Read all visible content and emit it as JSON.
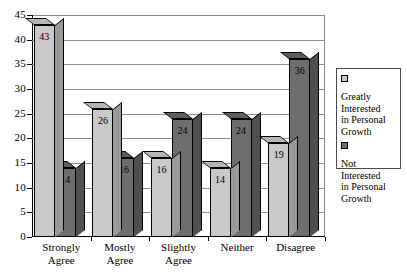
{
  "chart_data": {
    "type": "bar",
    "title": "",
    "subtitle": "",
    "xlabel": "",
    "ylabel": "",
    "categories": [
      "Strongly Agree",
      "Mostly Agree",
      "Slightly Agree",
      "Neither",
      "Disagree"
    ],
    "category_lines": [
      [
        "Strongly",
        "Agree"
      ],
      [
        "Mostly",
        "Agree"
      ],
      [
        "Slightly",
        "Agree"
      ],
      [
        "Neither",
        ""
      ],
      [
        "Disagree",
        ""
      ]
    ],
    "series": [
      {
        "name": "Greatly Interested in Personal Growth",
        "name_lines": [
          "Greatly",
          "Interested",
          "in Personal",
          "Growth"
        ],
        "color": "#c9c9c9",
        "side_color": "#9a9a9a",
        "top_color": "#b5b5b5",
        "values": [
          43,
          26,
          16,
          14,
          19
        ]
      },
      {
        "name": "Not Interested in Personal Growth",
        "name_lines": [
          "Not",
          "Interested",
          "in Personal",
          "Growth"
        ],
        "color": "#6e6e6e",
        "side_color": "#4f4f4f",
        "top_color": "#5e5e5e",
        "values": [
          14,
          16,
          24,
          24,
          36
        ]
      }
    ],
    "ylim": [
      0,
      45
    ],
    "ytick_values": [
      0,
      5,
      10,
      15,
      20,
      25,
      30,
      35,
      40,
      45
    ],
    "ytick_labels": [
      "0",
      "5",
      "10",
      "15",
      "20",
      "25",
      "30",
      "35",
      "40",
      "45"
    ],
    "grid": true,
    "grid_axis": "y",
    "legend_position": "right",
    "three_d": true,
    "data_labels": true,
    "background_color": "#ffffff",
    "axis_color": "#000000",
    "grid_color": "#8f8f8f"
  }
}
